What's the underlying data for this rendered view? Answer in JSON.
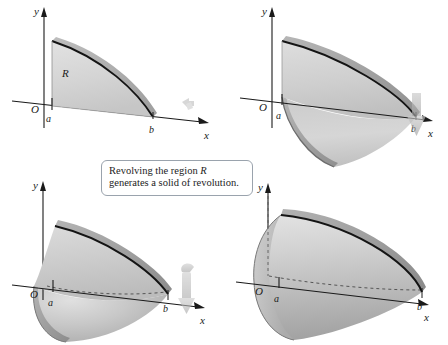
{
  "figure": {
    "title_text": "",
    "background": "#ffffff",
    "ink": "#1a1a1a"
  },
  "caption": {
    "line1_pre": "Revolving the region ",
    "line1_italic": "R",
    "line2": "generates a solid of revolution.",
    "border_color": "#9aa3ad"
  },
  "panels": [
    {
      "id": "panel-1",
      "name": "region-r-panel",
      "stage_label": "plane region R before revolution",
      "axes": {
        "y_label": "y",
        "x_label": "x",
        "origin_label": "O"
      },
      "ticks": [
        {
          "label": "a",
          "name": "tick-a"
        },
        {
          "label": "b",
          "name": "tick-b"
        }
      ],
      "region_label": "R",
      "rotation_arrow": "small-rotation-arrow",
      "colors": {
        "face": "#d7d7d7",
        "edge_band": "#b0b0b0",
        "curve": "#141414"
      }
    },
    {
      "id": "panel-2",
      "name": "partial-revolution-panel",
      "stage_label": "region swept partway around the x-axis",
      "axes": {
        "y_label": "y",
        "x_label": "x",
        "origin_label": "O"
      },
      "ticks": [
        {
          "label": "a",
          "name": "tick-a"
        },
        {
          "label": "b",
          "name": "tick-b"
        }
      ],
      "region_label": "",
      "rotation_arrow": "down-arrow",
      "colors": {
        "face": "#cfcfcf",
        "edge_band": "#a8a8a8",
        "curve": "#141414"
      }
    },
    {
      "id": "panel-3",
      "name": "half-revolution-panel",
      "stage_label": "region swept roughly half a turn forming a part solid",
      "axes": {
        "y_label": "y",
        "x_label": "x",
        "origin_label": "O"
      },
      "ticks": [
        {
          "label": "a",
          "name": "tick-a"
        },
        {
          "label": "b",
          "name": "tick-b"
        }
      ],
      "region_label": "",
      "rotation_arrow": "curved-rotation-arrow",
      "colors": {
        "face": "#c9c9c9",
        "edge_band": "#a3a3a3",
        "curve": "#141414"
      }
    },
    {
      "id": "panel-4",
      "name": "solid-of-revolution-panel",
      "stage_label": "complete solid of revolution",
      "axes": {
        "y_label": "y",
        "x_label": "x",
        "origin_label": "O"
      },
      "ticks": [
        {
          "label": "a",
          "name": "tick-a"
        },
        {
          "label": "b",
          "name": "tick-b"
        }
      ],
      "region_label": "",
      "rotation_arrow": "",
      "colors": {
        "face": "#c4c4c4",
        "edge_band": "#9d9d9d",
        "curve": "#141414"
      }
    }
  ]
}
